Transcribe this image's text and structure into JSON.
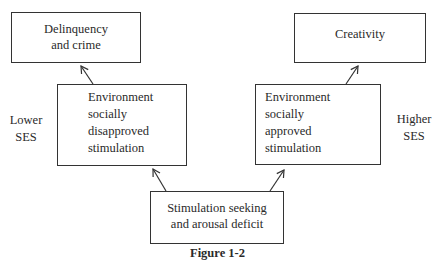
{
  "boxes": {
    "delinquency": {
      "line1": "Delinquency",
      "line2": "and crime"
    },
    "creativity": {
      "line1": "Creativity"
    },
    "env_left": {
      "line1": "Environment",
      "line2": "socially",
      "line3": "disapproved",
      "line4": "stimulation"
    },
    "env_right": {
      "line1": "Environment",
      "line2": "socially",
      "line3": "approved",
      "line4": "stimulation"
    },
    "stimulation": {
      "line1": "Stimulation seeking",
      "line2": "and arousal deficit"
    }
  },
  "labels": {
    "lower": {
      "line1": "Lower",
      "line2": "SES"
    },
    "higher": {
      "line1": "Higher",
      "line2": "SES"
    }
  },
  "caption": "Figure 1-2"
}
